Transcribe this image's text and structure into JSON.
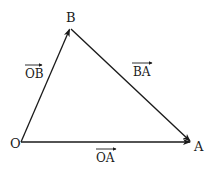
{
  "diagram": {
    "type": "vector-triangle",
    "points": {
      "O": {
        "label": "O",
        "x": 21,
        "y": 142
      },
      "B": {
        "label": "B",
        "x": 70,
        "y": 28
      },
      "A": {
        "label": "A",
        "x": 191,
        "y": 142
      }
    },
    "vectors": [
      {
        "id": "OB",
        "from": "O",
        "to": "B",
        "label": "OB"
      },
      {
        "id": "BA",
        "from": "B",
        "to": "A",
        "label": "BA"
      },
      {
        "id": "OA",
        "from": "O",
        "to": "A",
        "label": "OA"
      }
    ],
    "colors": {
      "stroke": "#1a1a1a",
      "background": "#ffffff"
    }
  }
}
